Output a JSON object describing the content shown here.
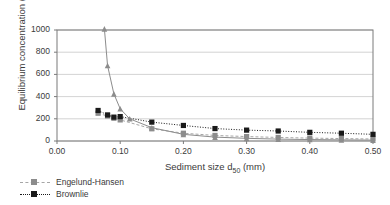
{
  "chart_data": {
    "type": "line",
    "title": "",
    "xlabel_text": "Sediment size d",
    "xlabel_sub": "50",
    "xlabel_unit": " (mm)",
    "xlabel": "Sediment size d50 (mm)",
    "ylabel": "Equilibrium concentration (ppm)",
    "xlim": [
      0.0,
      0.5
    ],
    "ylim": [
      0,
      1000
    ],
    "grid": "horizontal",
    "legend_position": "below-axis-left",
    "xticks": [
      "0.00",
      "0.10",
      "0.20",
      "0.30",
      "0.40",
      "0.50"
    ],
    "xtick_values": [
      0.0,
      0.1,
      0.2,
      0.3,
      0.4,
      0.5
    ],
    "yticks": [
      "0",
      "200",
      "400",
      "600",
      "800",
      "1000"
    ],
    "ytick_values": [
      0,
      200,
      400,
      600,
      800,
      1000
    ],
    "series": [
      {
        "name": "Engelund-Hansen",
        "marker": "square",
        "marker_color": "#8c8c8c",
        "line_color": "#a6a6a6",
        "line_style": "dashed",
        "x": [
          0.065,
          0.08,
          0.09,
          0.1,
          0.15,
          0.2,
          0.25,
          0.3,
          0.35,
          0.4,
          0.45,
          0.5
        ],
        "values": [
          250,
          225,
          205,
          190,
          110,
          70,
          50,
          40,
          32,
          26,
          22,
          18
        ]
      },
      {
        "name": "Brownlie",
        "marker": "square",
        "marker_color": "#1a1a1a",
        "line_color": "#1a1a1a",
        "line_style": "dotted",
        "x": [
          0.065,
          0.08,
          0.09,
          0.1,
          0.15,
          0.2,
          0.25,
          0.3,
          0.35,
          0.4,
          0.45,
          0.5
        ],
        "values": [
          275,
          235,
          215,
          220,
          170,
          140,
          112,
          98,
          90,
          78,
          70,
          60
        ]
      },
      {
        "name": "",
        "marker": "triangle",
        "marker_color": "#8c8c8c",
        "line_color": "#8c8c8c",
        "line_style": "solid",
        "x": [
          0.075,
          0.08,
          0.09,
          0.1,
          0.115,
          0.15,
          0.2,
          0.25,
          0.3,
          0.35,
          0.4,
          0.45,
          0.5
        ],
        "values": [
          1010,
          680,
          425,
          290,
          200,
          120,
          60,
          35,
          24,
          17,
          13,
          10,
          8
        ]
      }
    ]
  },
  "legend": {
    "entries": [
      {
        "label": "Engelund-Hansen"
      },
      {
        "label": "Brownlie"
      }
    ]
  }
}
